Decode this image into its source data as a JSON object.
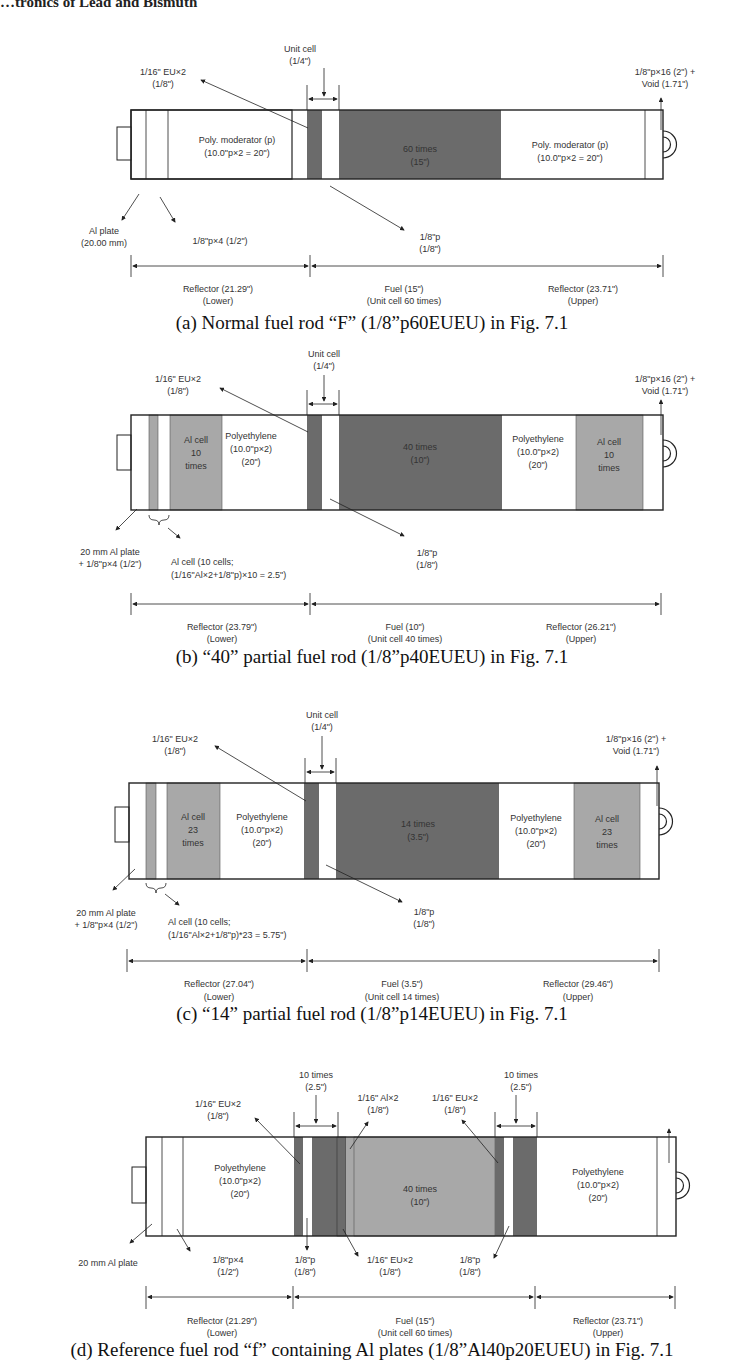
{
  "header": {
    "running_title": "…tronics of Lead and Bismuth"
  },
  "panels": {
    "a": {
      "caption": "(a)  Normal fuel rod “F” (1/8”p60EUEU) in Fig. 7.1",
      "unit_cell": [
        "Unit cell",
        "(1/4\")"
      ],
      "eu_label": [
        "1/16\" EU×2",
        "(1/8\")"
      ],
      "top_right": [
        "1/8\"p×16 (2\") +",
        "Void (1.71\")"
      ],
      "lower_mod": [
        "Poly. moderator (p)",
        "(10.0\"p×2 = 20\")"
      ],
      "fuel_block": [
        "60 times",
        "(15\")"
      ],
      "upper_mod": [
        "Poly. moderator (p)",
        "(10.0\"p×2 = 20\")"
      ],
      "al_plate": [
        "Al plate",
        "(20.00 mm)"
      ],
      "p4": "1/8\"p×4 (1/2\")",
      "p8": [
        "1/8\"p",
        "(1/8\")"
      ],
      "dims": [
        [
          "Reflector (21.29\")",
          "(Lower)"
        ],
        [
          "Fuel (15\")",
          "(Unit cell 60 times)"
        ],
        [
          "Reflector (23.71\")",
          "(Upper)"
        ]
      ]
    },
    "b": {
      "caption": "(b)  “40” partial fuel rod (1/8”p40EUEU) in Fig. 7.1",
      "unit_cell": [
        "Unit cell",
        "(1/4\")"
      ],
      "eu_label": [
        "1/16\" EU×2",
        "(1/8\")"
      ],
      "top_right": [
        "1/8\"p×16 (2\") +",
        "Void (1.71\")"
      ],
      "al_cell_lower": [
        "Al cell",
        "10",
        "times"
      ],
      "poly_lower": [
        "Polyethylene",
        "(10.0\"p×2)",
        "(20\")"
      ],
      "fuel_block": [
        "40 times",
        "(10\")"
      ],
      "poly_upper": [
        "Polyethylene",
        "(10.0\"p×2)",
        "(20\")"
      ],
      "al_cell_upper": [
        "Al cell",
        "10",
        "times"
      ],
      "al_plate": [
        "20 mm Al plate",
        "+ 1/8\"p×4 (1/2\")"
      ],
      "al_cell_note": [
        "Al cell (10 cells;",
        "(1/16\"Al×2+1/8\"p)×10 = 2.5\")"
      ],
      "p8": [
        "1/8\"p",
        "(1/8\")"
      ],
      "dims": [
        [
          "Reflector (23.79\")",
          "(Lower)"
        ],
        [
          "Fuel (10\")",
          "(Unit cell 40 times)"
        ],
        [
          "Reflector (26.21\")",
          "(Upper)"
        ]
      ]
    },
    "c": {
      "caption": "(c)  “14” partial fuel rod (1/8”p14EUEU) in Fig. 7.1",
      "unit_cell": [
        "Unit cell",
        "(1/4\")"
      ],
      "eu_label": [
        "1/16\" EU×2",
        "(1/8\")"
      ],
      "top_right": [
        "1/8\"p×16 (2\") +",
        "Void (1.71\")"
      ],
      "al_cell_lower": [
        "Al cell",
        "23",
        "times"
      ],
      "poly_lower": [
        "Polyethylene",
        "(10.0\"p×2)",
        "(20\")"
      ],
      "fuel_block": [
        "14 times",
        "(3.5\")"
      ],
      "poly_upper": [
        "Polyethylene",
        "(10.0\"p×2)",
        "(20\")"
      ],
      "al_cell_upper": [
        "Al cell",
        "23",
        "times"
      ],
      "al_plate": [
        "20 mm Al plate",
        "+ 1/8\"p×4 (1/2\")"
      ],
      "al_cell_note": [
        "Al cell (10 cells;",
        "(1/16\"Al×2+1/8\"p)*23 = 5.75\")"
      ],
      "p8": [
        "1/8\"p",
        "(1/8\")"
      ],
      "dims": [
        [
          "Reflector (27.04\")",
          "(Lower)"
        ],
        [
          "Fuel (3.5\")",
          "(Unit cell 14 times)"
        ],
        [
          "Reflector (29.46\")",
          "(Upper)"
        ]
      ]
    },
    "d": {
      "caption": "(d) Reference fuel rod “f” containing Al plates (1/8”Al40p20EUEU) in Fig. 7.1",
      "ten_left": [
        "10 times",
        "(2.5\")"
      ],
      "ten_right": [
        "10 times",
        "(2.5\")"
      ],
      "eu_left": [
        "1/16\" EU×2",
        "(1/8\")"
      ],
      "al_label": [
        "1/16\" Al×2",
        "(1/8\")"
      ],
      "eu_right": [
        "1/16\" EU×2",
        "(1/8\")"
      ],
      "poly_lower": [
        "Polyethylene",
        "(10.0\"p×2)",
        "(20\")"
      ],
      "fuel_block": [
        "40 times",
        "(10\")"
      ],
      "poly_upper": [
        "Polyethylene",
        "(10.0\"p×2)",
        "(20\")"
      ],
      "al_plate": "20 mm Al plate",
      "p4": [
        "1/8\"p×4",
        "(1/2\")"
      ],
      "p8_left": [
        "1/8\"p",
        "(1/8\")"
      ],
      "eu_bottom": [
        "1/16\" EU×2",
        "(1/8\")"
      ],
      "p8_right": [
        "1/8\"p",
        "(1/8\")"
      ],
      "dims": [
        [
          "Reflector (21.29\")",
          "(Lower)"
        ],
        [
          "Fuel (15\")",
          "(Unit cell 60 times)"
        ],
        [
          "Reflector (23.71\")",
          "(Upper)"
        ]
      ]
    }
  }
}
